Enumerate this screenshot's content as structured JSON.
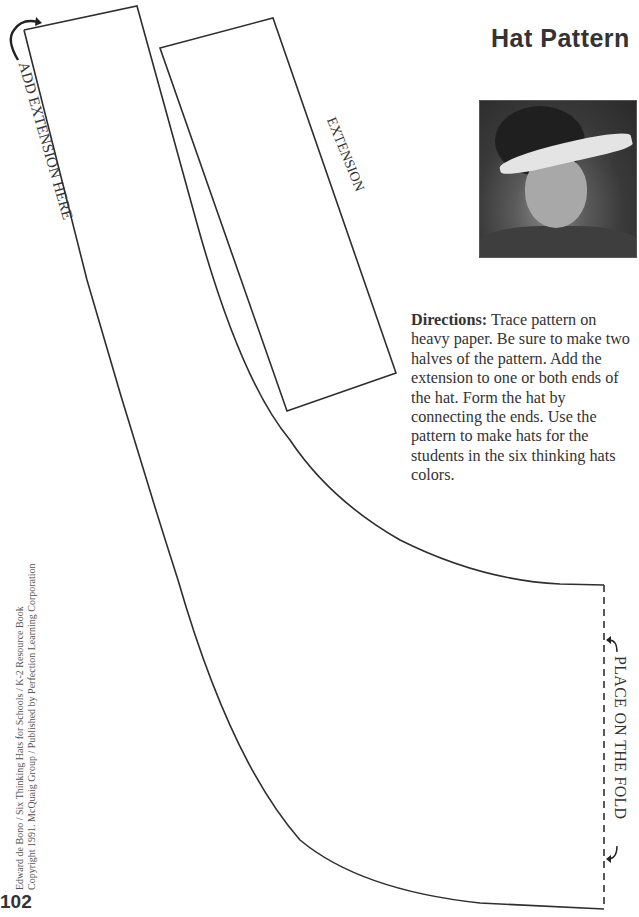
{
  "page": {
    "title": "Hat Pattern",
    "page_number": "102"
  },
  "photo": {
    "description": "Black-and-white photo of a smiling child wearing a paper visor hat"
  },
  "directions": {
    "label": "Directions:",
    "text": " Trace pattern on heavy paper. Be sure to make two halves of the pattern. Add the extension to one or both ends of the hat. Form the hat by connecting the ends. Use the pattern to make hats for the students in the six thinking hats colors."
  },
  "pattern": {
    "add_extension_label": "ADD EXTENSION HERE",
    "extension_label": "EXTENSION",
    "fold_label": "PLACE ON THE FOLD",
    "line_color": "#2e2e2e"
  },
  "footer": {
    "copyright_line1": "Edward de Bono / Six Thinking Hats for Schools / K-2 Resource Book",
    "copyright_line2": "Copyright 1991. McQuaig Group / Published by Perfection Learning Corporation"
  }
}
